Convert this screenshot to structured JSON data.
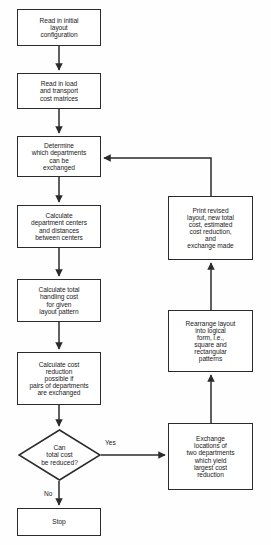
{
  "diagram": {
    "type": "flowchart",
    "colors": {
      "background": "#fefefe",
      "node_fill": "#ffffff",
      "stroke": "#2b2b2b",
      "text": "#1a1a1a"
    },
    "nodes": [
      {
        "id": "read-initial-layout",
        "shape": "process",
        "text": "Read in initial\nlayout\nconfiguration",
        "x": 17,
        "y": 9,
        "w": 84,
        "h": 37
      },
      {
        "id": "read-load-transport",
        "shape": "process",
        "text": "Read in load\nand transport\ncost matrices",
        "x": 17,
        "y": 73,
        "w": 84,
        "h": 36
      },
      {
        "id": "determine-departments",
        "shape": "process",
        "text": "Determine\nwhich departments\ncan be\nexchanged",
        "x": 17,
        "y": 136,
        "w": 84,
        "h": 41
      },
      {
        "id": "calculate-centers",
        "shape": "process",
        "text": "Calculate\ndepartment centers\nand distances\nbetween centers",
        "x": 17,
        "y": 205,
        "w": 84,
        "h": 43
      },
      {
        "id": "calculate-handling-cost",
        "shape": "process",
        "text": "Calculate total\nhandling cost\nfor given\nlayout pattern",
        "x": 17,
        "y": 279,
        "w": 84,
        "h": 43
      },
      {
        "id": "calculate-cost-reduction",
        "shape": "process",
        "text": "Calculate cost\nreduction\npossible if\npairs of departments\nare exchanged",
        "x": 17,
        "y": 352,
        "w": 84,
        "h": 53
      },
      {
        "id": "can-total-cost-be-reduced",
        "shape": "decision",
        "text": "Can\ntotal cost\nbe reduced?",
        "x": 18,
        "y": 429,
        "w": 83,
        "h": 52
      },
      {
        "id": "stop",
        "shape": "process",
        "text": "Stop",
        "x": 17,
        "y": 508,
        "w": 84,
        "h": 28
      },
      {
        "id": "print-revised-layout",
        "shape": "process",
        "text": "Print revised\nlayout, new total\ncost, estimated\ncost reduction,\nand\nexchange made",
        "x": 168,
        "y": 196,
        "w": 85,
        "h": 64
      },
      {
        "id": "rearrange-layout",
        "shape": "process",
        "text": "Rearrange layout\ninto logical\nform, i.e.,\nsquare and\nrectangular\npatterns",
        "x": 168,
        "y": 310,
        "w": 85,
        "h": 62
      },
      {
        "id": "exchange-locations",
        "shape": "process",
        "text": "Exchange\nlocations of\ntwo departments\nwhich yield\nlargest cost\nreduction",
        "x": 168,
        "y": 423,
        "w": 85,
        "h": 67
      }
    ],
    "edge_labels": [
      {
        "id": "yes-label",
        "text": "Yes",
        "x": 105,
        "y": 440
      },
      {
        "id": "no-label",
        "text": "No",
        "x": 44,
        "y": 491
      }
    ]
  }
}
